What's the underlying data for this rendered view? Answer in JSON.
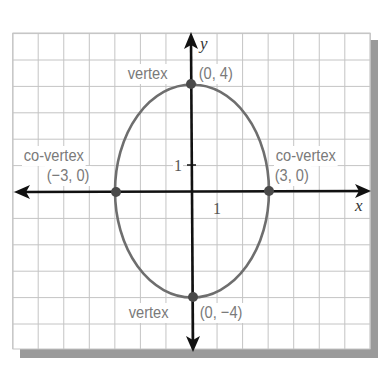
{
  "figure": {
    "x_axis_label": "x",
    "y_axis_label": "y",
    "x_tick_label": "1",
    "y_tick_label": "1"
  },
  "labels": {
    "top_vertex_word": "vertex",
    "top_vertex_coord": "(0, 4)",
    "bottom_vertex_word": "vertex",
    "bottom_vertex_coord": "(0, −4)",
    "left_covertex_word": "co-vertex",
    "left_covertex_coord": "(−3, 0)",
    "right_covertex_word": "co-vertex",
    "right_covertex_coord": "(3, 0)"
  },
  "colors": {
    "grid": "#c4c4c4",
    "axis": "#111111",
    "ellipse": "#6e6e6e",
    "point": "#4a4a4a",
    "label_text": "#7a7a7a",
    "shadow": "#9a9a9a"
  },
  "chart_data": {
    "type": "diagram",
    "title": "",
    "shape": "ellipse",
    "center": [
      0,
      0
    ],
    "semi_major_axis": 4,
    "semi_minor_axis": 3,
    "orientation": "vertical",
    "xlim": [
      -7,
      7
    ],
    "ylim": [
      -6,
      6
    ],
    "grid": true,
    "xlabel": "x",
    "ylabel": "y",
    "points": [
      {
        "label": "vertex",
        "coord": "(0, 4)",
        "x": 0,
        "y": 4
      },
      {
        "label": "vertex",
        "coord": "(0, −4)",
        "x": 0,
        "y": -4
      },
      {
        "label": "co-vertex",
        "coord": "(−3, 0)",
        "x": -3,
        "y": 0
      },
      {
        "label": "co-vertex",
        "coord": "(3, 0)",
        "x": 3,
        "y": 0
      }
    ]
  }
}
